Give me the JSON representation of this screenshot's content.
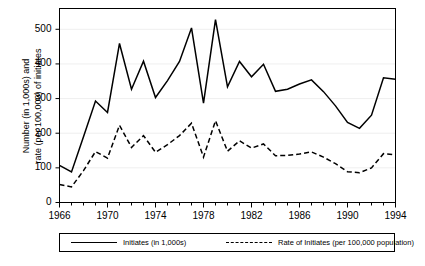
{
  "chart_data": {
    "type": "line",
    "title": "",
    "xlabel": "",
    "ylabel": "Number (in 1,000s) and rate (per 100,000) of initiates",
    "ylabel_line1": "Number (in 1,000s) and",
    "ylabel_line2": "rate (per 100,000) of initiates",
    "xlim": [
      1966,
      1994
    ],
    "ylim": [
      0,
      560
    ],
    "yticks": [
      0,
      100,
      200,
      300,
      400,
      500
    ],
    "ytick_labels": [
      "0",
      "100",
      "200",
      "300",
      "400",
      "500"
    ],
    "xticks": [
      1966,
      1970,
      1974,
      1978,
      1982,
      1986,
      1990,
      1994
    ],
    "xtick_labels": [
      "1966",
      "1970",
      "1974",
      "1978",
      "1982",
      "1986",
      "1990",
      "1994"
    ],
    "x": [
      1966,
      1967,
      1968,
      1969,
      1970,
      1971,
      1972,
      1973,
      1974,
      1975,
      1976,
      1977,
      1978,
      1979,
      1980,
      1981,
      1982,
      1983,
      1984,
      1985,
      1986,
      1987,
      1988,
      1989,
      1990,
      1991,
      1992,
      1993,
      1994
    ],
    "grid": true,
    "grid_axis": "y",
    "legend_position": "bottom",
    "series": [
      {
        "name": "Initiates (in 1,000s)",
        "style": "solid",
        "color": "#000000",
        "values": [
          107,
          88,
          190,
          293,
          260,
          459,
          327,
          408,
          303,
          352,
          407,
          504,
          287,
          528,
          334,
          407,
          363,
          399,
          321,
          327,
          342,
          354,
          320,
          279,
          231,
          214,
          252,
          360,
          356
        ]
      },
      {
        "name": "Rate of Initiates (per 100,000 population)",
        "style": "dashed",
        "color": "#000000",
        "values": [
          52,
          45,
          92,
          147,
          128,
          223,
          159,
          193,
          145,
          167,
          193,
          229,
          131,
          236,
          148,
          178,
          157,
          169,
          135,
          136,
          140,
          146,
          131,
          112,
          89,
          86,
          100,
          141,
          138
        ]
      }
    ]
  },
  "legend": {
    "entries": [
      {
        "label": "Initiates (in 1,000s)",
        "style": "solid"
      },
      {
        "label": "Rate of Initiates (per 100,000 population)",
        "style": "dashed"
      }
    ]
  }
}
